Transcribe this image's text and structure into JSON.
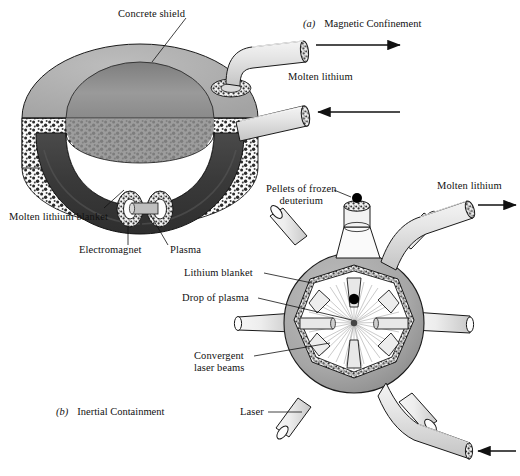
{
  "figure": {
    "panels": [
      {
        "key": "a",
        "marker": "(a)",
        "title": "Magnetic Confinement"
      },
      {
        "key": "b",
        "marker": "(b)",
        "title": "Inertial Containment"
      }
    ]
  },
  "panel_a": {
    "labels": {
      "concrete_shield": "Concrete shield",
      "molten_lithium": "Molten lithium",
      "molten_lithium_blanket": "Molten lithium blanket",
      "electromagnet": "Electromagnet",
      "plasma": "Plasma"
    },
    "flows": [
      {
        "name": "outlet",
        "direction": "right",
        "label": "Molten lithium"
      },
      {
        "name": "inlet",
        "direction": "left",
        "label": "Molten lithium"
      }
    ]
  },
  "panel_b": {
    "labels": {
      "pellets": "Pellets of frozen\ndeuterium",
      "pellets_line1": "Pellets of frozen",
      "pellets_line2": "deuterium",
      "molten_lithium": "Molten lithium",
      "lithium_blanket": "Lithium blanket",
      "drop_of_plasma": "Drop of plasma",
      "convergent_line1": "Convergent",
      "convergent_line2": "laser beams",
      "laser": "Laser"
    },
    "laser_count": 8,
    "flows": [
      {
        "name": "outlet",
        "direction": "right",
        "label": "Molten lithium"
      },
      {
        "name": "inlet",
        "direction": "left",
        "label": ""
      }
    ]
  },
  "colors": {
    "shield_top": "#adadad",
    "shield_inner": "#8f8f8f",
    "lithium_dark": "#3a3a3a",
    "sphere_shell": "#a8a8a8",
    "pipe_light": "#e2e2e2",
    "pipe_shade": "#c9c9c9",
    "outline": "#1a1a1a",
    "white": "#ffffff",
    "plasma_dot": "#000000"
  }
}
